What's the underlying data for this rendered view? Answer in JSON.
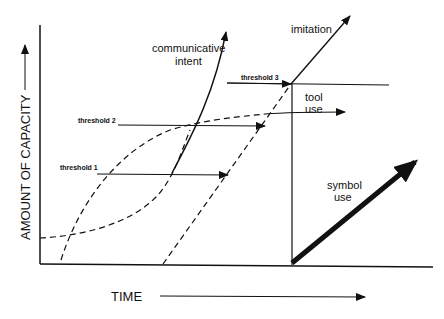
{
  "diagram": {
    "y_axis_label": "AMOUNT OF CAPACITY",
    "x_axis_label": "TIME",
    "curves": {
      "communicative_intent": "communicative intent",
      "imitation": "imitation",
      "tool_use_line1": "tool",
      "tool_use_line2": "use",
      "symbol_use_line1": "symbol",
      "symbol_use_line2": "use",
      "comm_line1": "communicative",
      "comm_line2": "intent"
    },
    "thresholds": {
      "t1": "threshold 1",
      "t2": "threshold 2",
      "t3": "threshold 3"
    },
    "colors": {
      "ink": "#111111",
      "background": "#ffffff"
    }
  }
}
